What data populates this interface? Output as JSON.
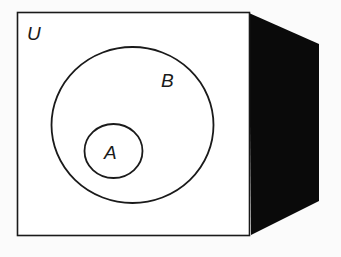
{
  "diagram": {
    "type": "venn",
    "universe_label": "U",
    "sets": [
      {
        "label": "B",
        "contains": [
          "A"
        ]
      },
      {
        "label": "A",
        "subset_of": "B"
      }
    ],
    "colors": {
      "background": "#fbfbfb",
      "outline": "#1a1a1a",
      "side_face": "#0a0a0a"
    }
  }
}
